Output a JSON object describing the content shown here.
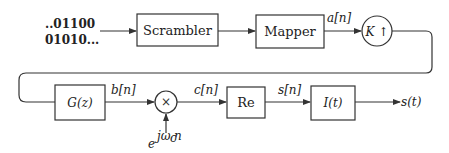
{
  "diagram": {
    "input_bits": {
      "line1": "..01100",
      "line2": "01010..."
    },
    "blocks": [
      {
        "id": "scrambler",
        "label": "Scrambler"
      },
      {
        "id": "mapper",
        "label": "Mapper"
      },
      {
        "id": "upsampler",
        "label": "K ↑"
      },
      {
        "id": "filter",
        "label": "G(z)"
      },
      {
        "id": "multiplier",
        "label": "×"
      },
      {
        "id": "real-part",
        "label": "Re"
      },
      {
        "id": "interpolator",
        "label": "I(t)"
      }
    ],
    "signals": {
      "a": "a[n]",
      "b": "b[n]",
      "c": "c[n]",
      "s_discrete": "s[n]",
      "s_continuous": "s(t)",
      "carrier_base": "e",
      "carrier_exp": "jω",
      "carrier_sub": "c",
      "carrier_n": "n"
    }
  }
}
